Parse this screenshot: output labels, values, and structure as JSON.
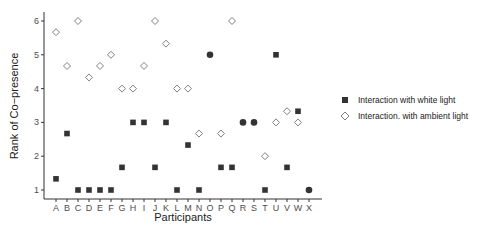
{
  "chart_data": {
    "type": "scatter",
    "title": "",
    "xlabel": "Participants",
    "ylabel": "Rank of Co−presence",
    "ylim": [
      1,
      6
    ],
    "yticks": [
      1,
      2,
      3,
      4,
      5,
      6
    ],
    "grid": false,
    "legend_position": "right",
    "categories": [
      "A",
      "B",
      "C",
      "D",
      "E",
      "F",
      "G",
      "H",
      "I",
      "J",
      "K",
      "L",
      "M",
      "N",
      "O",
      "P",
      "Q",
      "R",
      "S",
      "T",
      "U",
      "V",
      "W",
      "X"
    ],
    "series": [
      {
        "name": "Interaction with white light",
        "marker": "filled-square",
        "color": "#333333",
        "values": [
          1.33,
          2.67,
          1,
          1,
          1,
          1,
          1.67,
          3,
          3,
          1.67,
          3,
          1,
          2.33,
          1,
          5,
          1.67,
          1.67,
          3,
          3,
          1,
          5,
          1.67,
          3.33,
          1
        ]
      },
      {
        "name": "Interaction. with ambient light",
        "marker": "open-diamond",
        "color": "#7f7f7f",
        "values": [
          5.67,
          4.67,
          6,
          4.33,
          4.67,
          5,
          4,
          4,
          4.67,
          6,
          5.33,
          4,
          4,
          2.67,
          5,
          2.67,
          6,
          3,
          3,
          2,
          3,
          3.33,
          3,
          1
        ]
      }
    ]
  },
  "legend": {
    "items": [
      {
        "label": "Interaction with white light"
      },
      {
        "label": "Interaction. with ambient light"
      }
    ]
  }
}
